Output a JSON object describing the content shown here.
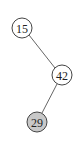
{
  "tree": {
    "nodes": [
      {
        "id": "n15",
        "label": "15",
        "cx": 22,
        "cy": 28,
        "r": 10,
        "fill": "#ffffff"
      },
      {
        "id": "n42",
        "label": "42",
        "cx": 62,
        "cy": 75,
        "r": 10,
        "fill": "#ffffff"
      },
      {
        "id": "n29",
        "label": "29",
        "cx": 37,
        "cy": 122,
        "r": 10,
        "fill": "#c8c8c8"
      }
    ],
    "edges": [
      {
        "from": "15",
        "to": "42",
        "relation": "right-child"
      },
      {
        "from": "42",
        "to": "29",
        "relation": "left-child"
      }
    ]
  }
}
